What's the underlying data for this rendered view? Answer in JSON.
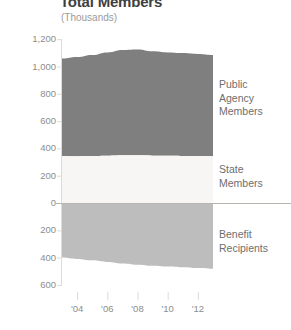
{
  "header": {
    "title": "Total Members",
    "subtitle": "(Thousands)"
  },
  "chart_data": {
    "type": "area",
    "title": "Total Members",
    "subtitle": "(Thousands)",
    "unit": "Thousands",
    "stacked": true,
    "diverging": true,
    "xlabel": "",
    "ylabel": "",
    "grid": false,
    "legend_position": "right",
    "x": [
      2003,
      2004,
      2005,
      2006,
      2007,
      2008,
      2009,
      2010,
      2011,
      2012,
      2013
    ],
    "x_tick_labels": [
      "'04",
      "'06",
      "'08",
      "'10",
      "'12"
    ],
    "x_tick_values": [
      2004,
      2006,
      2008,
      2010,
      2012
    ],
    "y_tick_labels": [
      "1,200",
      "1,000",
      "800",
      "600",
      "400",
      "200",
      "0",
      "200",
      "400",
      "600"
    ],
    "y_tick_values": [
      1200,
      1000,
      800,
      600,
      400,
      200,
      0,
      -200,
      -400,
      -600
    ],
    "ylim": [
      -640,
      1260
    ],
    "series": [
      {
        "name": "Public Agency Members",
        "color": "#7f7f7f",
        "direction": "up",
        "values": [
          713,
          726,
          740,
          757,
          772,
          776,
          764,
          757,
          753,
          748,
          742
        ]
      },
      {
        "name": "State Members",
        "color": "#f7f6f4",
        "direction": "up",
        "values": [
          345,
          343,
          344,
          346,
          349,
          349,
          347,
          346,
          345,
          344,
          343
        ]
      },
      {
        "name": "Benefit Recipients",
        "color": "#bdbdbd",
        "direction": "down",
        "values": [
          400,
          410,
          420,
          432,
          443,
          452,
          460,
          466,
          471,
          477,
          482
        ]
      }
    ],
    "stack_totals_up": [
      1058,
      1069,
      1084,
      1103,
      1121,
      1125,
      1111,
      1103,
      1098,
      1092,
      1085
    ]
  },
  "legend": {
    "public_agency": "Public\nAgency\nMembers",
    "state": "State\nMembers",
    "benefit": "Benefit\nRecipients"
  },
  "colors": {
    "public_agency": "#7f7f7f",
    "state": "#f7f6f4",
    "benefit": "#bdbdbd",
    "axis_text": "#8d8d8d",
    "legend_text": "#6e6e6e",
    "title_text": "#3f3f3f",
    "zero_line": "#b8b5b0",
    "tick_line": "#dedbd6"
  }
}
